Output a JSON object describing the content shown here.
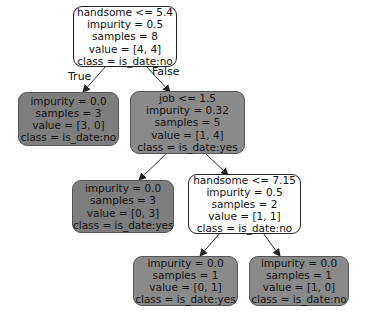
{
  "tree": {
    "nodes": [
      {
        "id": "root",
        "lines": [
          "handsome <= 5.4",
          "impurity = 0.5",
          "samples = 8",
          "value = [4, 4]",
          "class = is_date:no"
        ],
        "fill": "#ffffff"
      },
      {
        "id": "leaf-left",
        "lines": [
          "impurity = 0.0",
          "samples = 3",
          "value = [3, 0]",
          "class = is_date:no"
        ],
        "fill": "#7e7e7e"
      },
      {
        "id": "job",
        "lines": [
          "job <= 1.5",
          "impurity = 0.32",
          "samples = 5",
          "value = [1, 4]",
          "class = is_date:yes"
        ],
        "fill": "#8a8a8a"
      },
      {
        "id": "leaf-mid",
        "lines": [
          "impurity = 0.0",
          "samples = 3",
          "value = [0, 3]",
          "class = is_date:yes"
        ],
        "fill": "#7e7e7e"
      },
      {
        "id": "handsome2",
        "lines": [
          "handsome <= 7.15",
          "impurity = 0.5",
          "samples = 2",
          "value = [1, 1]",
          "class = is_date:no"
        ],
        "fill": "#ffffff"
      },
      {
        "id": "leaf-bl",
        "lines": [
          "impurity = 0.0",
          "samples = 1",
          "value = [0, 1]",
          "class = is_date:yes"
        ],
        "fill": "#8a8a8a"
      },
      {
        "id": "leaf-br",
        "lines": [
          "impurity = 0.0",
          "samples = 1",
          "value = [1, 0]",
          "class = is_date:no"
        ],
        "fill": "#8a8a8a"
      }
    ],
    "edge_labels": {
      "true": "True",
      "false": "False"
    }
  }
}
